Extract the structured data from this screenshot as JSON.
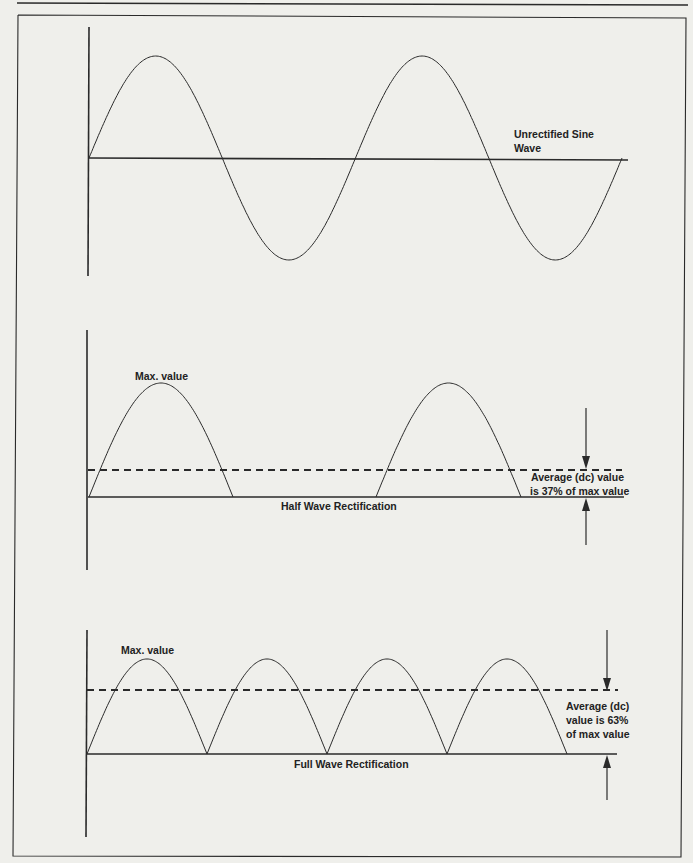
{
  "figure": {
    "panels": [
      {
        "id": "unrectified",
        "type": "line",
        "title": "Unrectified Sine Wave",
        "label_lines": [
          "Unrectified Sine",
          "Wave"
        ],
        "waveform": "sine",
        "cycles": 2
      },
      {
        "id": "half-wave",
        "type": "line",
        "title": "Half Wave Rectification",
        "max_label": "Max. value",
        "average_label_lines": [
          "Average (dc) value",
          "is 37% of max value"
        ],
        "average_fraction": 0.37,
        "waveform": "half-wave",
        "pulses": 2
      },
      {
        "id": "full-wave",
        "type": "line",
        "title": "Full Wave Rectification",
        "max_label": "Max. value",
        "average_label_lines": [
          "Average (dc)",
          "value is 63%",
          "of max value"
        ],
        "average_fraction": 0.63,
        "waveform": "full-wave",
        "pulses": 4
      }
    ],
    "colors": {
      "paper": "#efefeb",
      "ink": "#2a2a2a"
    }
  },
  "chart_data": [
    {
      "type": "line",
      "title": "Unrectified Sine Wave",
      "xlabel": "",
      "ylabel": "",
      "x_periods": [
        0,
        0.5,
        1,
        1.5,
        2
      ],
      "series": [
        {
          "name": "sine",
          "values_at_quarter_periods": [
            0,
            1,
            0,
            -1,
            0,
            1,
            0,
            -1,
            0
          ]
        }
      ],
      "ylim": [
        -1,
        1
      ],
      "grid": false
    },
    {
      "type": "line",
      "title": "Half Wave Rectification",
      "annotations": [
        "Max. value",
        "Average (dc) value is 37% of max value"
      ],
      "series": [
        {
          "name": "half-wave",
          "values_at_quarter_periods": [
            0,
            1,
            0,
            0,
            0,
            1,
            0,
            0,
            0
          ]
        }
      ],
      "average_line": 0.37,
      "ylim": [
        0,
        1
      ],
      "grid": false
    },
    {
      "type": "line",
      "title": "Full Wave Rectification",
      "annotations": [
        "Max. value",
        "Average (dc) value is 63% of max value"
      ],
      "series": [
        {
          "name": "full-wave",
          "values_at_quarter_periods": [
            0,
            1,
            0,
            1,
            0,
            1,
            0,
            1,
            0
          ]
        }
      ],
      "average_line": 0.63,
      "ylim": [
        0,
        1
      ],
      "grid": false
    }
  ]
}
